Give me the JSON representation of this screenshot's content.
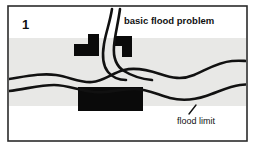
{
  "figure": {
    "panel_number": "1",
    "title": "basic flood problem",
    "frame": {
      "x": 8,
      "y": 6,
      "width": 239,
      "height": 135,
      "border_color": "#2b2b2b"
    },
    "background_color": "#ffffff"
  },
  "floodplain": {
    "name": "flood zone band",
    "fill_color": "#e8e8e6",
    "top": 38,
    "bottom": 106
  },
  "river": {
    "stroke_color": "#111111",
    "stroke_width": 2.6,
    "north_bank_path": "M9,79 C28,76 42,73 56,75 C70,77 80,83 92,82 C104,81 112,73 124,70 C136,67 148,70 160,74 C172,78 182,80 194,75 C206,70 218,62 232,61 C240,60.5 244,61 247,61",
    "south_bank_path": "M9,91 C26,89 40,85 54,85 C68,85 80,91 94,92 C108,93 120,89 134,89 C148,89 158,95 170,98 C182,101 194,100 206,96 C218,92 230,86 240,85 C244,84.6 246,84.5 247,84.4",
    "tributary_west_path": "M112,9 C110,22 106,32 104,44 C102,56 103,66 108,72 C113,78 120,80 126,80",
    "tributary_east_path": "M120,9 C118,24 115,34 114,46 C113,58 116,66 124,71 C132,76 142,79 152,80"
  },
  "buildings": [
    {
      "name": "building-left",
      "shape": "L-shaped footprint",
      "fill_color": "#0a0a0a",
      "points": "74,56 74,44 88,44 88,34 99,34 99,56"
    },
    {
      "name": "building-right",
      "shape": "L-shaped footprint",
      "fill_color": "#0a0a0a",
      "points": "114,36 132,36 132,57 122,57 122,46 114,46"
    },
    {
      "name": "building-large",
      "shape": "rectangular footprint",
      "fill_color": "#0a0a0a",
      "x": 78,
      "y": 87,
      "width": 65,
      "height": 24
    }
  ],
  "annotations": {
    "flood_limit": {
      "label": "flood limit",
      "label_x": 196,
      "label_y": 124,
      "leader_line": {
        "x1": 189,
        "y1": 114,
        "x2": 196,
        "y2": 105,
        "stroke_color": "#111111"
      }
    }
  }
}
